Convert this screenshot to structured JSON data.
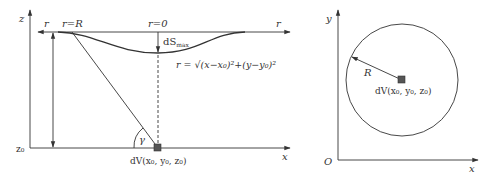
{
  "left_panel": {
    "axis_z_label": "z",
    "axis_x_label": "x",
    "z0_label": "z₀",
    "r_left_label": "r",
    "r_right_label": "r",
    "r_eq_R_label": "r=R",
    "r_eq_0_label": "r=0",
    "dS_max_label": "dS",
    "dS_max_sub": "max",
    "r_formula": "r = √(x−x₀)²+(y−y₀)²",
    "gamma_label": "γ",
    "source_label": "dV(x₀, y₀, z₀)"
  },
  "right_panel": {
    "axis_y_label": "y",
    "axis_x_label": "x",
    "origin_label": "O",
    "radius_label": "R",
    "source_label": "dV(x₀, y₀, z₀)"
  },
  "colors": {
    "line": "#333333",
    "source_marker": "#555555"
  }
}
